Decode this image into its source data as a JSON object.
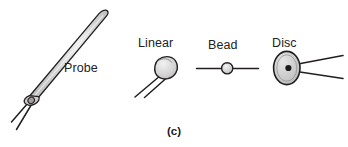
{
  "figure": {
    "caption": "(c)",
    "background_color": "#ffffff",
    "outline_color": "#231f20",
    "body_fill_color": "#c9c9c9",
    "highlight_color": "#efefef",
    "lead_color": "#231f20",
    "label_color": "#222222",
    "items": [
      {
        "key": "probe",
        "label": "Probe",
        "shape": "needle-probe",
        "label_x": 64,
        "label_y": 72,
        "lead_count": 2
      },
      {
        "key": "linear",
        "label": "Linear",
        "shape": "teardrop-disc",
        "label_x": 138,
        "label_y": 47,
        "lead_count": 2
      },
      {
        "key": "bead",
        "label": "Bead",
        "shape": "inline-bead",
        "label_x": 208,
        "label_y": 49,
        "lead_count": 2
      },
      {
        "key": "disc",
        "label": "Disc",
        "shape": "ellipse-disc",
        "label_x": 272,
        "label_y": 47,
        "lead_count": 2
      }
    ],
    "caption_x": 174,
    "caption_y": 135
  }
}
